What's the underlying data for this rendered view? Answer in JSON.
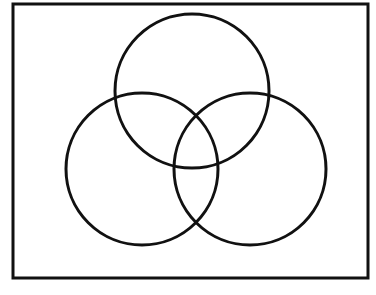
{
  "figure": {
    "kind": "venn-diagram",
    "title": "",
    "caption": "",
    "mirrored": true,
    "background_color": "#ffffff",
    "stroke_color": "#111111",
    "border": {
      "name": "figure-border",
      "x": 13,
      "y": 4,
      "width": 355,
      "height": 274,
      "stroke_width": 3
    },
    "circles": [
      {
        "id": "circle-g",
        "label": "G",
        "cx": 192,
        "cy": 91,
        "r": 77,
        "stroke_width": 3,
        "fill": "none",
        "label_x": 188,
        "label_y": 38
      },
      {
        "id": "circle-f",
        "label": "F",
        "cx": 142,
        "cy": 169,
        "r": 76,
        "stroke_width": 3,
        "fill": "none",
        "label_x": 136,
        "label_y": 228
      },
      {
        "id": "circle-e",
        "label": "E",
        "cx": 250,
        "cy": 169,
        "r": 76,
        "stroke_width": 3,
        "fill": "none",
        "label_x": 277,
        "label_y": 228
      }
    ],
    "labels": {
      "top": "G",
      "bottom_left": "F",
      "bottom_right": "E"
    }
  }
}
